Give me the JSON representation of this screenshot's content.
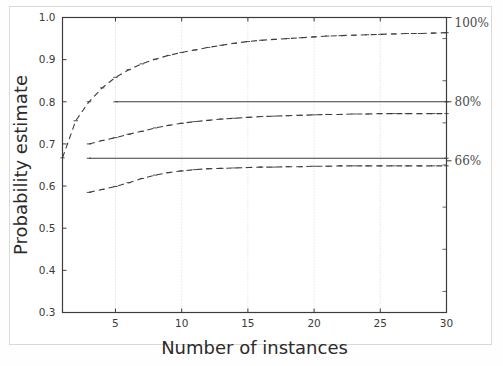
{
  "chart_data": {
    "type": "line",
    "title": "",
    "xlabel": "Number of instances",
    "ylabel": "Probability estimate",
    "xlim": [
      1,
      30
    ],
    "ylim": [
      0.3,
      1.0
    ],
    "xticks": [
      5,
      10,
      15,
      20,
      25,
      30
    ],
    "xtick_labels": [
      "5",
      "10",
      "15",
      "20",
      "25",
      "30"
    ],
    "yticks": [
      0.3,
      0.4,
      0.5,
      0.6,
      0.7,
      0.8,
      0.9,
      1.0
    ],
    "ytick_labels": [
      "0.3",
      "0.4",
      "0.5",
      "0.6",
      "0.7",
      "0.8",
      "0.9",
      "1.0"
    ],
    "grid": "vertical-dotted",
    "legend": "none",
    "right_axis_annotations": [
      {
        "label": "100%",
        "value": 1.0
      },
      {
        "label": "80%",
        "value": 0.8
      },
      {
        "label": "66%",
        "value": 0.66
      }
    ],
    "series": [
      {
        "name": "100% curve",
        "style": "dashed",
        "color": "#3c3c3c",
        "x": [
          1,
          2,
          3,
          4,
          5,
          6,
          7,
          8,
          9,
          10,
          11,
          12,
          13,
          14,
          15,
          16,
          17,
          18,
          19,
          20,
          21,
          22,
          23,
          24,
          25,
          26,
          27,
          28,
          29,
          30
        ],
        "y": [
          0.667,
          0.755,
          0.8,
          0.833,
          0.858,
          0.876,
          0.89,
          0.901,
          0.91,
          0.917,
          0.923,
          0.929,
          0.934,
          0.939,
          0.943,
          0.946,
          0.948,
          0.95,
          0.952,
          0.954,
          0.956,
          0.957,
          0.958,
          0.959,
          0.96,
          0.961,
          0.962,
          0.962,
          0.963,
          0.964
        ]
      },
      {
        "name": "80% curve",
        "style": "dashed",
        "color": "#3c3c3c",
        "x": [
          3,
          4,
          5,
          6,
          7,
          8,
          9,
          10,
          11,
          12,
          13,
          14,
          15,
          16,
          17,
          18,
          19,
          20,
          21,
          22,
          23,
          24,
          25,
          26,
          27,
          28,
          29,
          30
        ],
        "y": [
          0.7,
          0.708,
          0.715,
          0.723,
          0.73,
          0.738,
          0.744,
          0.749,
          0.753,
          0.756,
          0.759,
          0.761,
          0.763,
          0.765,
          0.766,
          0.767,
          0.768,
          0.769,
          0.77,
          0.77,
          0.771,
          0.771,
          0.772,
          0.772,
          0.772,
          0.772,
          0.772,
          0.772
        ]
      },
      {
        "name": "66% curve",
        "style": "dashed",
        "color": "#3c3c3c",
        "x": [
          3,
          4,
          5,
          6,
          7,
          8,
          9,
          10,
          11,
          12,
          13,
          14,
          15,
          16,
          17,
          18,
          19,
          20,
          21,
          22,
          23,
          24,
          25,
          26,
          27,
          28,
          29,
          30
        ],
        "y": [
          0.585,
          0.592,
          0.599,
          0.608,
          0.618,
          0.626,
          0.632,
          0.636,
          0.639,
          0.641,
          0.642,
          0.643,
          0.644,
          0.645,
          0.645,
          0.646,
          0.646,
          0.647,
          0.647,
          0.648,
          0.648,
          0.648,
          0.648,
          0.648,
          0.648,
          0.648,
          0.648,
          0.648
        ]
      },
      {
        "name": "80% reference",
        "style": "solid",
        "color": "#3c3c3c",
        "x": [
          5,
          30
        ],
        "y": [
          0.8,
          0.8
        ]
      },
      {
        "name": "66% reference",
        "style": "solid",
        "color": "#3c3c3c",
        "x": [
          3,
          30
        ],
        "y": [
          0.666,
          0.666
        ]
      }
    ]
  },
  "colors": {
    "axis": "#3c3c3c",
    "grid": "#cccccc",
    "frame": "#d9d9d9",
    "text": "#2b2b2b",
    "background": "#ffffff"
  }
}
